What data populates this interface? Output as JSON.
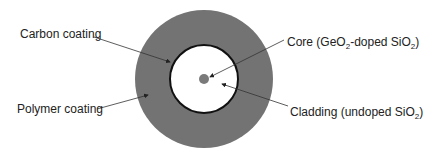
{
  "diagram": {
    "colors": {
      "polymer": "#737373",
      "cladding": "#ffffff",
      "carbon": "#111111",
      "core": "#7a7a7a",
      "line": "#333333"
    },
    "labels": {
      "carbon": "Carbon coating",
      "polymer": "Polymer coating",
      "core_prefix": "Core (GeO",
      "core_sub1": "2",
      "core_mid": "-doped SiO",
      "core_sub2": "2",
      "core_suffix": ")",
      "cladding_prefix": "Cladding (undoped SiO",
      "cladding_sub": "2",
      "cladding_suffix": ")"
    }
  }
}
